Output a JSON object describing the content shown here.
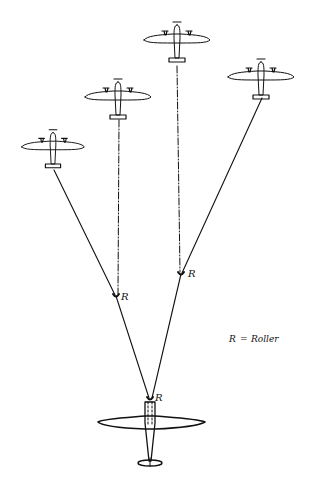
{
  "diagram": {
    "type": "aerial-refuelling-formation-sketch",
    "receivers": [
      {
        "id": "receiver-1",
        "cx": 53,
        "cy": 145
      },
      {
        "id": "receiver-2",
        "cx": 118,
        "cy": 95
      },
      {
        "id": "receiver-3",
        "cx": 177,
        "cy": 38
      },
      {
        "id": "receiver-4",
        "cx": 261,
        "cy": 75
      }
    ],
    "tanker": {
      "id": "tanker",
      "cx": 150,
      "cy": 428
    },
    "rollers": [
      {
        "id": "roller-left",
        "x": 116,
        "y": 295,
        "label": "R"
      },
      {
        "id": "roller-right",
        "x": 181,
        "y": 273,
        "label": "R"
      },
      {
        "id": "roller-tanker",
        "x": 150,
        "y": 398,
        "label": "R"
      }
    ],
    "legend": {
      "key": "R",
      "separator": "=",
      "meaning": "Roller"
    },
    "ink_color": "#111111",
    "background_color": "#ffffff"
  }
}
